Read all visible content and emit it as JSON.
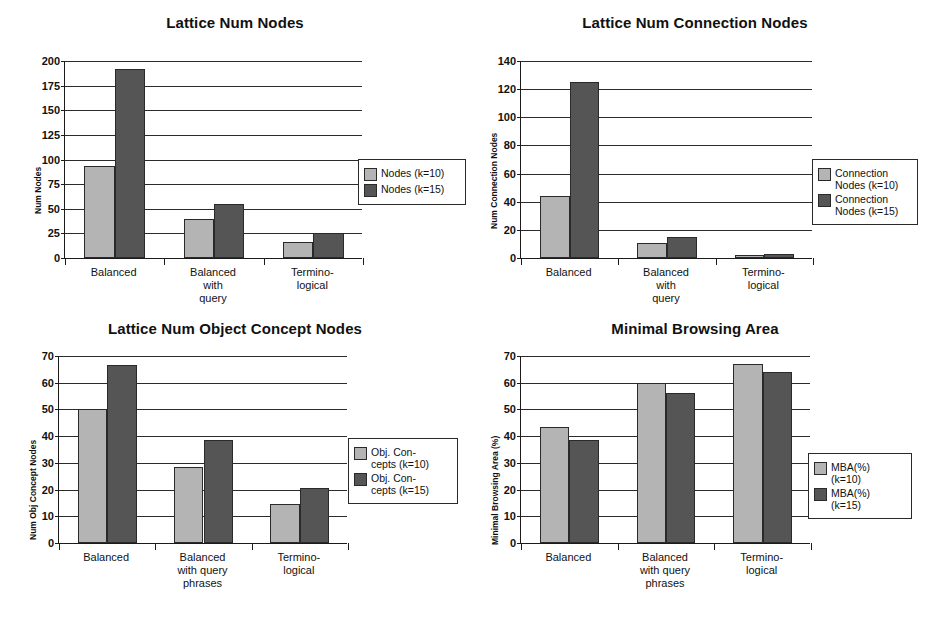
{
  "figure": {
    "background": "#ffffff",
    "series_colors": {
      "k10": "#b4b4b4",
      "k15": "#555555"
    }
  },
  "charts": [
    {
      "id": "lattice-num-nodes",
      "chart_data": {
        "type": "bar",
        "title": "Lattice Num Nodes",
        "xlabel": "",
        "ylabel": "Num Nodes",
        "categories": [
          "Balanced",
          "Balanced\nwith\nquery",
          "Termino-\nlogical"
        ],
        "series": [
          {
            "name": "Nodes (k=10)",
            "values": [
              93,
              40,
              16
            ]
          },
          {
            "name": "Nodes (k=15)",
            "values": [
              192,
              55,
              25
            ]
          }
        ],
        "ylim": [
          0,
          200
        ],
        "yticks": [
          0,
          25,
          50,
          75,
          100,
          125,
          150,
          175,
          200
        ],
        "ytick_labels": [
          "0",
          "25",
          "50",
          "75",
          "100",
          "125",
          "150",
          "175",
          "200"
        ],
        "grid": true,
        "legend_position": "right"
      }
    },
    {
      "id": "lattice-num-connection-nodes",
      "chart_data": {
        "type": "bar",
        "title": "Lattice Num Connection Nodes",
        "xlabel": "",
        "ylabel": "Num Connection Nodes",
        "categories": [
          "Balanced",
          "Balanced\nwith\nquery",
          "Termino-\nlogical"
        ],
        "series": [
          {
            "name": "Connection\nNodes (k=10)",
            "values": [
              44,
              11,
              2
            ]
          },
          {
            "name": "Connection\nNodes (k=15)",
            "values": [
              125,
              15,
              3
            ]
          }
        ],
        "ylim": [
          0,
          140
        ],
        "yticks": [
          0,
          20,
          40,
          60,
          80,
          100,
          120,
          140
        ],
        "ytick_labels": [
          "0",
          "20",
          "40",
          "60",
          "80",
          "100",
          "120",
          "140"
        ],
        "grid": true,
        "legend_position": "right"
      }
    },
    {
      "id": "lattice-num-object-concept-nodes",
      "chart_data": {
        "type": "bar",
        "title": "Lattice Num Object Concept Nodes",
        "xlabel": "",
        "ylabel": "Num Obj Concept Nodes",
        "categories": [
          "Balanced",
          "Balanced\nwith query\nphrases",
          "Termino-\nlogical"
        ],
        "series": [
          {
            "name": "Obj. Con-\ncepts (k=10)",
            "values": [
              50,
              28.5,
              14.5
            ]
          },
          {
            "name": "Obj. Con-\ncepts (k=15)",
            "values": [
              66.5,
              38.5,
              20.5
            ]
          }
        ],
        "ylim": [
          0,
          70
        ],
        "yticks": [
          0,
          10,
          20,
          30,
          40,
          50,
          60,
          70
        ],
        "ytick_labels": [
          "0",
          "10",
          "20",
          "30",
          "40",
          "50",
          "60",
          "70"
        ],
        "grid": true,
        "legend_position": "right"
      }
    },
    {
      "id": "minimal-browsing-area",
      "chart_data": {
        "type": "bar",
        "title": "Minimal Browsing Area",
        "xlabel": "",
        "ylabel": "Minimal Browsing Area (%)",
        "categories": [
          "Balanced",
          "Balanced\nwith query\nphrases",
          "Termino-\nlogical"
        ],
        "series": [
          {
            "name": "MBA(%)\n(k=10)",
            "values": [
              43.5,
              60,
              67
            ]
          },
          {
            "name": "MBA(%)\n(k=15)",
            "values": [
              38.5,
              56,
              64
            ]
          }
        ],
        "ylim": [
          0,
          70
        ],
        "yticks": [
          0,
          10,
          20,
          30,
          40,
          50,
          60,
          70
        ],
        "ytick_labels": [
          "0",
          "10",
          "20",
          "30",
          "40",
          "50",
          "60",
          "70"
        ],
        "grid": true,
        "legend_position": "right"
      }
    }
  ]
}
